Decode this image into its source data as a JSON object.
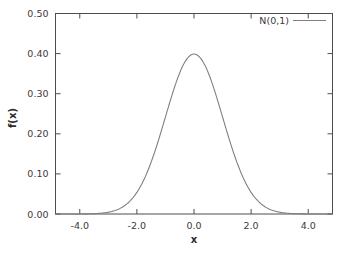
{
  "chart_data": {
    "type": "line",
    "title": "",
    "xlabel": "x",
    "ylabel": "f(x)",
    "xlim": [
      -4.85,
      4.85
    ],
    "ylim": [
      0.0,
      0.5
    ],
    "grid": false,
    "legend_position": "top-right inside plot frame",
    "xticks": [
      -4.0,
      -2.0,
      0.0,
      2.0,
      4.0
    ],
    "xticklabels": [
      "-4.0",
      "-2.0",
      "0.0",
      "2.0",
      "4.0"
    ],
    "yticks": [
      0.0,
      0.1,
      0.2,
      0.3,
      0.4,
      0.5
    ],
    "yticklabels": [
      "0.00",
      "0.10",
      "0.20",
      "0.30",
      "0.40",
      "0.50"
    ],
    "series": [
      {
        "name": "N(0,1)",
        "color": "#808080",
        "mean": 0.0,
        "stddev": 1.0,
        "peak_value": 0.3989,
        "x": [
          -4.85,
          -4.6,
          -4.4,
          -4.2,
          -4.0,
          -3.8,
          -3.6,
          -3.4,
          -3.2,
          -3.0,
          -2.8,
          -2.6,
          -2.4,
          -2.2,
          -2.0,
          -1.8,
          -1.6,
          -1.4,
          -1.2,
          -1.0,
          -0.8,
          -0.6,
          -0.4,
          -0.2,
          0.0,
          0.2,
          0.4,
          0.6,
          0.8,
          1.0,
          1.2,
          1.4,
          1.6,
          1.8,
          2.0,
          2.2,
          2.4,
          2.6,
          2.8,
          3.0,
          3.2,
          3.4,
          3.6,
          3.8,
          4.0,
          4.2,
          4.4,
          4.6,
          4.85
        ],
        "values": [
          0.0,
          0.0,
          0.0,
          0.0001,
          0.0001,
          0.0003,
          0.0006,
          0.0012,
          0.0024,
          0.0044,
          0.0079,
          0.0136,
          0.0224,
          0.0355,
          0.054,
          0.079,
          0.1109,
          0.1497,
          0.1942,
          0.242,
          0.2897,
          0.3332,
          0.3683,
          0.391,
          0.3989,
          0.391,
          0.3683,
          0.3332,
          0.2897,
          0.242,
          0.1942,
          0.1497,
          0.1109,
          0.079,
          0.054,
          0.0355,
          0.0224,
          0.0136,
          0.0079,
          0.0044,
          0.0024,
          0.0012,
          0.0006,
          0.0003,
          0.0001,
          0.0001,
          0.0,
          0.0,
          0.0
        ]
      }
    ]
  },
  "axes": {
    "x_title": "x",
    "y_title": "f(x)"
  },
  "legend": {
    "entries": [
      {
        "label": "N(0,1)"
      }
    ]
  },
  "ticks": {
    "x": [
      "-4.0",
      "-2.0",
      "0.0",
      "2.0",
      "4.0"
    ],
    "y": [
      "0.00",
      "0.10",
      "0.20",
      "0.30",
      "0.40",
      "0.50"
    ]
  },
  "colors": {
    "curve": "#808080",
    "frame": "#4d4d4d",
    "text": "#3a3a3a",
    "background": "#ffffff"
  }
}
